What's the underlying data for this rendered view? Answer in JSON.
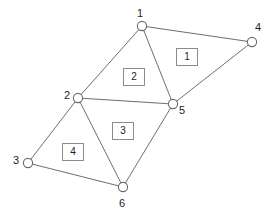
{
  "figure": {
    "background_color": "#ffffff",
    "edge_color": "#6e6e6e",
    "node_fill_color": "#ffffff",
    "node_stroke_color": "#6a6a6a",
    "label_color": "#1d1d1d",
    "face_box_border_color": "#8c8c8c"
  },
  "nodes": [
    {
      "id": "1",
      "label": "1",
      "cx": 142,
      "cy": 26,
      "r": 4.6,
      "label_x": 137,
      "label_y": 8
    },
    {
      "id": "2",
      "label": "2",
      "cx": 78,
      "cy": 98,
      "r": 4.6,
      "label_x": 64,
      "label_y": 90
    },
    {
      "id": "3",
      "label": "3",
      "cx": 28,
      "cy": 163,
      "r": 4.6,
      "label_x": 13,
      "label_y": 155
    },
    {
      "id": "4",
      "label": "4",
      "cx": 252,
      "cy": 42,
      "r": 4.6,
      "label_x": 255,
      "label_y": 22
    },
    {
      "id": "5",
      "label": "5",
      "cx": 173,
      "cy": 104,
      "r": 4.6,
      "label_x": 179,
      "label_y": 105
    },
    {
      "id": "6",
      "label": "6",
      "cx": 123,
      "cy": 187,
      "r": 4.6,
      "label_x": 119,
      "label_y": 198
    }
  ],
  "edges": [
    {
      "id": "e-1-4",
      "from": "1",
      "to": "4",
      "x1": 142,
      "y1": 26,
      "x2": 252,
      "y2": 42
    },
    {
      "id": "e-1-2",
      "from": "1",
      "to": "2",
      "x1": 142,
      "y1": 26,
      "x2": 78,
      "y2": 98
    },
    {
      "id": "e-1-5",
      "from": "1",
      "to": "5",
      "x1": 142,
      "y1": 26,
      "x2": 173,
      "y2": 104
    },
    {
      "id": "e-4-5",
      "from": "4",
      "to": "5",
      "x1": 252,
      "y1": 42,
      "x2": 173,
      "y2": 104
    },
    {
      "id": "e-2-5",
      "from": "2",
      "to": "5",
      "x1": 78,
      "y1": 98,
      "x2": 173,
      "y2": 104
    },
    {
      "id": "e-2-3",
      "from": "2",
      "to": "3",
      "x1": 78,
      "y1": 98,
      "x2": 28,
      "y2": 163
    },
    {
      "id": "e-2-6",
      "from": "2",
      "to": "6",
      "x1": 78,
      "y1": 98,
      "x2": 123,
      "y2": 187
    },
    {
      "id": "e-5-6",
      "from": "5",
      "to": "6",
      "x1": 173,
      "y1": 104,
      "x2": 123,
      "y2": 187
    },
    {
      "id": "e-3-6",
      "from": "3",
      "to": "6",
      "x1": 28,
      "y1": 163,
      "x2": 123,
      "y2": 187
    }
  ],
  "faces": [
    {
      "id": "f1",
      "label": "1",
      "vertices": [
        "1",
        "4",
        "5"
      ],
      "box_x": 176,
      "box_y": 48
    },
    {
      "id": "f2",
      "label": "2",
      "vertices": [
        "1",
        "2",
        "5"
      ],
      "box_x": 123,
      "box_y": 68
    },
    {
      "id": "f3",
      "label": "3",
      "vertices": [
        "2",
        "5",
        "6"
      ],
      "box_x": 112,
      "box_y": 122
    },
    {
      "id": "f4",
      "label": "4",
      "vertices": [
        "2",
        "3",
        "6"
      ],
      "box_x": 62,
      "box_y": 143
    }
  ]
}
